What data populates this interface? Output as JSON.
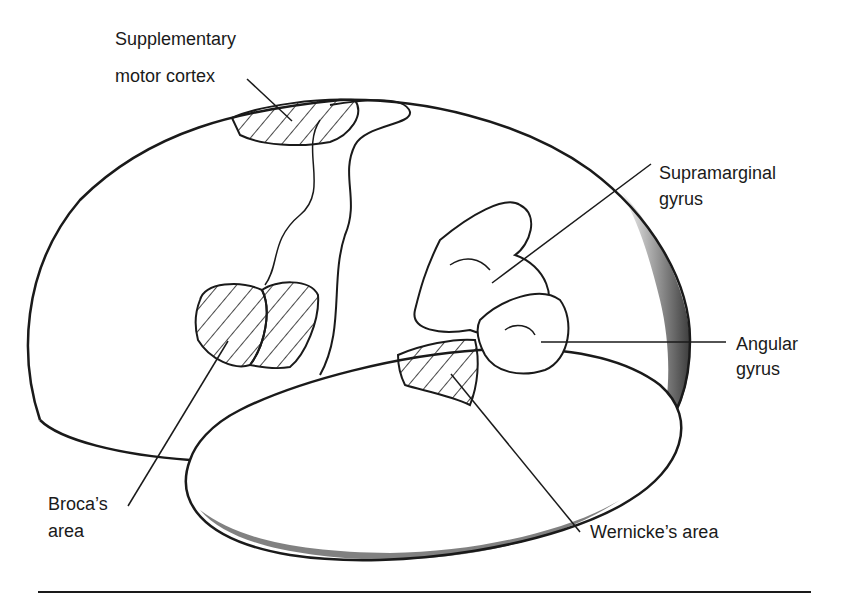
{
  "diagram": {
    "type": "brain-lateral-view",
    "labels": {
      "supplementary_motor_cortex": [
        "Supplementary",
        "motor cortex"
      ],
      "supramarginal_gyrus": [
        "Supramarginal",
        "gyrus"
      ],
      "angular_gyrus": [
        "Angular",
        "gyrus"
      ],
      "brocas_area": [
        "Broca’s",
        "area"
      ],
      "wernickes_area": [
        "Wernicke’s area"
      ]
    },
    "colors": {
      "ink": "#1a1a1a",
      "background": "#ffffff"
    }
  }
}
